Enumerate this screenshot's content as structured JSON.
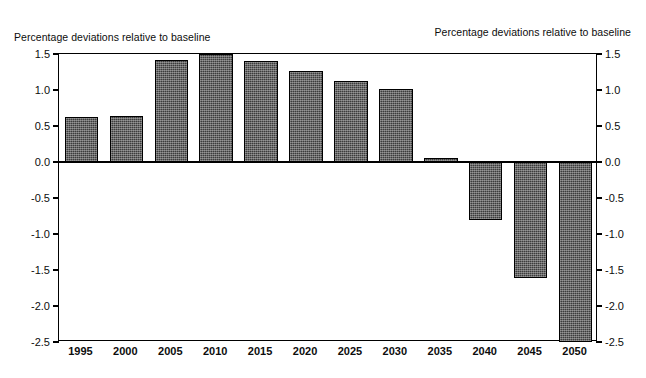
{
  "chart_data": {
    "type": "bar",
    "title": "",
    "left_axis_title": "Percentage deviations relative to baseline",
    "right_axis_title": "Percentage deviations relative to baseline",
    "xlabel": "",
    "ylabel": "Percentage deviations relative to baseline",
    "categories": [
      "1995",
      "2000",
      "2005",
      "2010",
      "2015",
      "2020",
      "2025",
      "2030",
      "2035",
      "2040",
      "2045",
      "2050"
    ],
    "values": [
      0.62,
      0.64,
      1.42,
      1.5,
      1.4,
      1.27,
      1.13,
      1.02,
      0.05,
      -0.8,
      -1.61,
      -2.5
    ],
    "ylim": [
      -2.5,
      1.5
    ],
    "yticks": [
      1.5,
      1.0,
      0.5,
      0.0,
      -0.5,
      -1.0,
      -1.5,
      -2.0,
      -2.5
    ],
    "ytick_labels": [
      "1.5",
      "1.0",
      "0.5",
      "0.0",
      "-0.5",
      "-1.0",
      "-1.5",
      "-2.0",
      "-2.5"
    ],
    "right_ytick_labels": [
      "1.5",
      "1.0",
      "0.5",
      "0.0",
      "-0.5",
      "-1.0",
      "-1.5",
      "-2.0",
      "-2.5"
    ],
    "grid": false,
    "legend": null,
    "bar_color": "#3c3c3c",
    "bar_edge_color": "#000000",
    "background_color": "#ffffff",
    "zero_line": 0.0
  }
}
